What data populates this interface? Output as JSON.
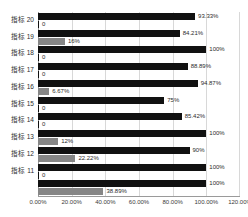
{
  "chart_data": {
    "type": "bar",
    "orientation": "horizontal",
    "title": "",
    "xlabel": "",
    "ylabel": "",
    "xlim": [
      0,
      120
    ],
    "grid": true,
    "legend": "none",
    "xticks": [
      "0.00%",
      "20.00%",
      "40.00%",
      "60.00%",
      "80.00%",
      "100.00%",
      "120.00%"
    ],
    "xtick_values": [
      0,
      20,
      40,
      60,
      80,
      100,
      120
    ],
    "categories": [
      "指标 20",
      "指标 19",
      "指标 18",
      "指标 17",
      "指标 16",
      "指标 15",
      "指标 14",
      "指标 13",
      "指标 12",
      "指标 11",
      ""
    ],
    "series": [
      {
        "name": "series-dark",
        "color": "#111111",
        "values": [
          93.33,
          84.21,
          100,
          88.89,
          94.87,
          75,
          85.42,
          100,
          90,
          100,
          100
        ],
        "labels": [
          "93.33%",
          "84.21%",
          "100%",
          "88.89%",
          "94.87%",
          "75%",
          "85.42%",
          "100%",
          "90%",
          "100%",
          "100%"
        ]
      },
      {
        "name": "series-gray",
        "color": "#868686",
        "values": [
          0,
          16,
          0,
          0,
          6.67,
          0,
          0,
          12,
          22.22,
          0,
          38.89
        ],
        "labels": [
          "0",
          "16%",
          "0",
          "0",
          "6.67%",
          "0",
          "0",
          "12%",
          "22.22%",
          "0",
          "38.89%"
        ]
      }
    ]
  }
}
